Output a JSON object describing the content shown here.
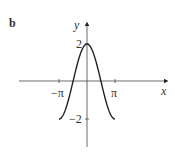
{
  "panel_label": "b",
  "chart_data": {
    "type": "line",
    "title": "",
    "xlabel": "x",
    "ylabel": "y",
    "function": "y = 2cos(x)",
    "xlim": [
      -3.14159,
      3.14159
    ],
    "ylim": [
      -2,
      2
    ],
    "x_ticks": [
      "−π",
      "π"
    ],
    "y_ticks": [
      "2",
      "−2"
    ],
    "grid": false,
    "series": [
      {
        "name": "2cos(x)",
        "x": [
          -3.14159,
          -1.5708,
          0,
          1.5708,
          3.14159
        ],
        "values": [
          -2,
          0,
          2,
          0,
          -2
        ]
      }
    ]
  }
}
